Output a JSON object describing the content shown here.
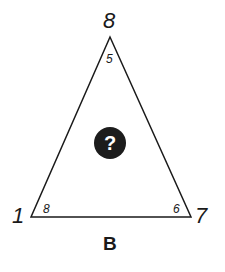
{
  "puzzle": {
    "label": "B",
    "unknown_symbol": "?",
    "colors": {
      "stroke": "#1a1a1a",
      "circle_fill": "#1c1c1c",
      "circle_text": "#ffffff",
      "background": "#ffffff"
    },
    "vertices": {
      "top": {
        "outer": "8",
        "inner": "5"
      },
      "bottom_left": {
        "outer": "1",
        "inner": "8"
      },
      "bottom_right": {
        "outer": "7",
        "inner": "6"
      }
    }
  }
}
